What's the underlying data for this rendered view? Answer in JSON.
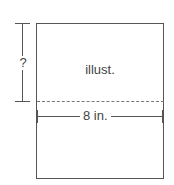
{
  "diagram": {
    "center_label": "illust.",
    "height_label": "?",
    "width_label": "8 in."
  }
}
